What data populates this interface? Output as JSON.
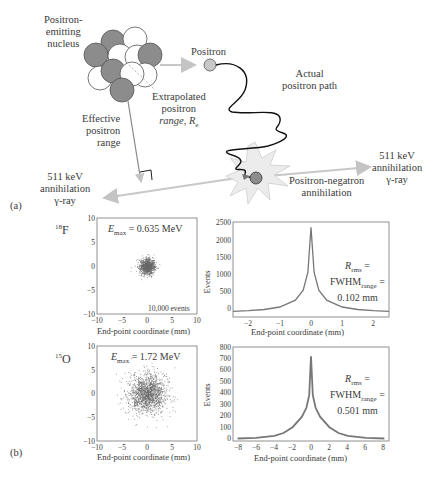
{
  "panel_a": {
    "label": "(a)",
    "nucleus_label": [
      "Positron-",
      "emitting",
      "nucleus"
    ],
    "positron_label": "Positron",
    "extrapolated_label": [
      "Extrapolated",
      "positron",
      "range, R"
    ],
    "extrapolated_sub": "e",
    "effective_label": [
      "Effective",
      "positron",
      "range"
    ],
    "actual_path_label": [
      "Actual",
      "positron path"
    ],
    "annihilation_label": [
      "Positron-negatron",
      "annihilation"
    ],
    "gamma_left_label": [
      "511 keV",
      "annihilation",
      "γ-ray"
    ],
    "gamma_right_label": [
      "511 keV",
      "annihilation",
      "γ-ray"
    ],
    "colors": {
      "proton": "#8c8c8c",
      "neutron": "#ffffff",
      "particle": "#c8c8c8",
      "arrow": "#c8c8c8",
      "star": "#ececec"
    }
  },
  "panel_b": {
    "label": "(b)",
    "rows": [
      {
        "isotope_mass": "18",
        "isotope_symbol": "F",
        "emax_label": "E",
        "emax_sub": "max",
        "emax_value": " = 0.635 MeV",
        "events_note": "10,000 events",
        "rrms_line1": "R",
        "rrms_sub": "rms",
        "rrms_eq": " =",
        "fwhm": "FWHM",
        "fwhm_sub": "range",
        "fwhm_eq": " =",
        "value": "0.102 mm"
      },
      {
        "isotope_mass": "15",
        "isotope_symbol": "O",
        "emax_label": "E",
        "emax_sub": "max",
        "emax_value": " = 1.72 MeV",
        "events_note": "",
        "rrms_line1": "R",
        "rrms_sub": "rms",
        "rrms_eq": " =",
        "fwhm": "FWHM",
        "fwhm_sub": "range",
        "fwhm_eq": " =",
        "value": "0.501 mm"
      }
    ]
  },
  "chart_data": [
    {
      "type": "scatter",
      "title": "18F end-point distribution",
      "annotation": "Emax = 0.635 MeV; 10,000 events",
      "xlabel": "End-point coordinate (mm)",
      "ylabel": "",
      "xlim": [
        -10,
        10
      ],
      "ylim": [
        -10,
        10
      ],
      "x_ticks": [
        "-10",
        "-5",
        "0",
        "5",
        "10"
      ],
      "y_ticks": [
        "-10",
        "-5",
        "0",
        "5",
        "10"
      ],
      "cloud_center": [
        0,
        0
      ],
      "cloud_radius_mm": 1.5,
      "n_points": 10000
    },
    {
      "type": "line",
      "title": "18F end-point histogram",
      "annotation": "Rrms = FWHMrange = 0.102 mm",
      "xlabel": "End-point coordinate (mm)",
      "ylabel": "Events",
      "xlim": [
        -2.5,
        2.5
      ],
      "ylim": [
        -150,
        2500
      ],
      "x_ticks": [
        "-2",
        "-1",
        "0",
        "1",
        "2"
      ],
      "y_ticks": [
        "0",
        "500",
        "1000",
        "1500",
        "2000",
        "2500"
      ],
      "x": [
        -2.5,
        -2,
        -1.5,
        -1,
        -0.5,
        -0.25,
        -0.1,
        0,
        0.1,
        0.25,
        0.5,
        1,
        1.5,
        2,
        2.5
      ],
      "values": [
        10,
        25,
        60,
        130,
        320,
        600,
        1100,
        2350,
        1100,
        600,
        320,
        130,
        60,
        25,
        10
      ]
    },
    {
      "type": "scatter",
      "title": "15O end-point distribution",
      "annotation": "Emax = 1.72 MeV",
      "xlabel": "End-point coordinate (mm)",
      "ylabel": "",
      "xlim": [
        -10,
        10
      ],
      "ylim": [
        -10,
        10
      ],
      "x_ticks": [
        "-10",
        "-5",
        "0",
        "5",
        "10"
      ],
      "y_ticks": [
        "-10",
        "-5",
        "0",
        "5",
        "10"
      ],
      "cloud_center": [
        0,
        0
      ],
      "cloud_radius_mm": 4,
      "n_points": 10000
    },
    {
      "type": "line",
      "title": "15O end-point histogram",
      "annotation": "Rrms = FWHMrange = 0.501 mm",
      "xlabel": "End-point coordinate (mm)",
      "ylabel": "Events",
      "xlim": [
        -8.5,
        8.5
      ],
      "ylim": [
        -20,
        800
      ],
      "x_ticks": [
        "-8",
        "-6",
        "-4",
        "-2",
        "0",
        "2",
        "4",
        "6",
        "8"
      ],
      "y_ticks": [
        "0",
        "100",
        "200",
        "300",
        "400",
        "500",
        "600",
        "700",
        "800"
      ],
      "x": [
        -8,
        -6,
        -4,
        -3,
        -2,
        -1,
        -0.5,
        -0.2,
        0,
        0.2,
        0.5,
        1,
        2,
        3,
        4,
        6,
        8
      ],
      "values": [
        2,
        8,
        25,
        50,
        100,
        190,
        270,
        380,
        720,
        380,
        270,
        190,
        100,
        50,
        25,
        8,
        2
      ]
    }
  ]
}
